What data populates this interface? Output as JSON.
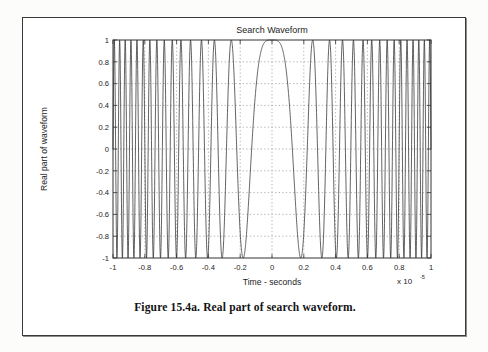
{
  "figure": {
    "caption": "Figure 15.4a. Real part of search waveform."
  },
  "chart_data": {
    "type": "line",
    "title": "Search Waveform",
    "xlabel": "Time - seconds",
    "ylabel": "Real part of waveform",
    "x_exponent_prefix": "x 10",
    "x_exponent_value": "-5",
    "xlim": [
      -1,
      1
    ],
    "ylim": [
      -1,
      1
    ],
    "grid": true,
    "grid_style": "dotted",
    "legend": "none",
    "line_color": "#2b2b2b",
    "xticks": [
      -1,
      -0.8,
      -0.6,
      -0.4,
      -0.2,
      0,
      0.2,
      0.4,
      0.6,
      0.8,
      1
    ],
    "xticklabels": [
      "-1",
      "-0.8",
      "-0.6",
      "-0.4",
      "-0.2",
      "0",
      "0.2",
      "0.4",
      "0.6",
      "0.8",
      "1"
    ],
    "yticks": [
      -1,
      -0.8,
      -0.6,
      -0.4,
      -0.2,
      0,
      0.2,
      0.4,
      0.6,
      0.8,
      1
    ],
    "yticklabels": [
      "-1",
      "-0.8",
      "-0.6",
      "-0.4",
      "-0.2",
      "0",
      "0.2",
      "0.4",
      "0.6",
      "0.8",
      "1"
    ],
    "waveform": {
      "description": "Real part of a linear-FM (chirp) search waveform: cos(pi*mu*t^2), frequency minimum at t=0 and increasing toward both ends of the sweep.",
      "function": "cos(pi * mu * t^2)",
      "mu_normalized": 30.5,
      "samples": 3000
    }
  }
}
